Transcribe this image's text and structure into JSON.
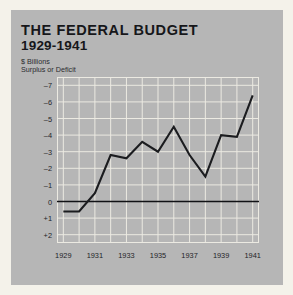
{
  "header": {
    "title_line1": "THE FEDERAL BUDGET",
    "title_line2": "1929-1941",
    "subtitle_line1": "$ Billions",
    "subtitle_line2": "Surplus or Deficit"
  },
  "colors": {
    "page_background": "#f4f2ea",
    "panel_background": "#b6b6b6",
    "gridline": "#eceae2",
    "line": "#1b1c1f",
    "zero_line": "#111215",
    "text": "#16171a"
  },
  "chart_data": {
    "type": "line",
    "title": "THE FEDERAL BUDGET 1929-1941",
    "subtitle": "$ Billions — Surplus or Deficit",
    "xlabel": "",
    "ylabel": "$ Billions",
    "x": [
      1929,
      1930,
      1931,
      1932,
      1933,
      1934,
      1935,
      1936,
      1937,
      1938,
      1939,
      1940,
      1941
    ],
    "values": [
      0.6,
      0.6,
      -0.5,
      -2.8,
      -2.6,
      -3.6,
      -3.0,
      -4.5,
      -2.8,
      -1.5,
      -4.0,
      -3.9,
      -6.4
    ],
    "series": [
      {
        "name": "Surplus or Deficit",
        "values": [
          0.6,
          0.6,
          -0.5,
          -2.8,
          -2.6,
          -3.6,
          -3.0,
          -4.5,
          -2.8,
          -1.5,
          -4.0,
          -3.9,
          -6.4
        ]
      }
    ],
    "y_axis_inverted": true,
    "ylim": [
      -7.5,
      2.5
    ],
    "xlim": [
      1928.6,
      1941.4
    ],
    "y_ticks": [
      -7,
      -6,
      -5,
      -4,
      -3,
      -2,
      -1,
      0,
      1,
      2
    ],
    "y_tick_labels": [
      "–7",
      "–6",
      "–5",
      "–4",
      "–3",
      "–2",
      "–1",
      "0",
      "+1",
      "+2"
    ],
    "x_ticks": [
      1929,
      1931,
      1933,
      1935,
      1937,
      1939,
      1941
    ],
    "x_tick_labels": [
      "1929",
      "1931",
      "1933",
      "1935",
      "1937",
      "1939",
      "1941"
    ],
    "x_minor_ticks": [
      1930,
      1932,
      1934,
      1936,
      1938,
      1940
    ],
    "grid": true,
    "legend": "none",
    "zero_reference_line": 0
  }
}
